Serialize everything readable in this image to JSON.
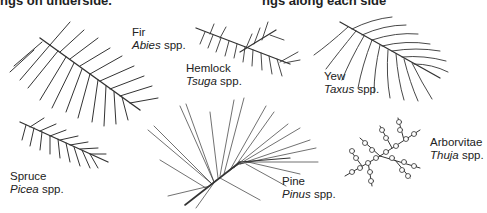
{
  "header": {
    "left_text": "ngs on underside.",
    "right_text": "ngs along each side"
  },
  "species": [
    {
      "common": "Fir",
      "genus": "Abies",
      "suffix": " spp."
    },
    {
      "common": "Hemlock",
      "genus": "Tsuga",
      "suffix": " spp."
    },
    {
      "common": "Yew",
      "genus": "Taxus",
      "suffix": " spp."
    },
    {
      "common": "Spruce",
      "genus": "Picea",
      "suffix": " spp."
    },
    {
      "common": "Pine",
      "genus": "Pinus",
      "suffix": " spp."
    },
    {
      "common": "Arborvitae",
      "genus": "Thuja",
      "suffix": " spp."
    }
  ],
  "colors": {
    "ink": "#333333",
    "background": "#ffffff"
  }
}
